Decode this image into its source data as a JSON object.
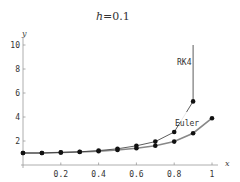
{
  "chart_data": {
    "type": "line",
    "title": "h=0.1",
    "title_var": "h",
    "title_value": "=0.1",
    "xlabel": "x",
    "ylabel": "y",
    "xlim": [
      0,
      1
    ],
    "ylim": [
      0,
      10
    ],
    "x_ticks": [
      "0.2",
      "0.4",
      "0.6",
      "0.8",
      "1"
    ],
    "y_ticks": [
      "2",
      "4",
      "6",
      "8",
      "10"
    ],
    "grid": false,
    "series": [
      {
        "name": "RK4",
        "color": "#333333",
        "x": [
          0,
          0.1,
          0.2,
          0.3,
          0.4,
          0.5,
          0.6,
          0.7,
          0.8,
          0.9
        ],
        "values": [
          1.0,
          1.0,
          1.05,
          1.1,
          1.2,
          1.35,
          1.6,
          1.95,
          2.75,
          5.3
        ],
        "tail_to": 10.0
      },
      {
        "name": "Euler",
        "color": "#888888",
        "x": [
          0,
          0.1,
          0.2,
          0.3,
          0.4,
          0.5,
          0.6,
          0.7,
          0.8,
          0.9,
          1.0
        ],
        "values": [
          1.0,
          1.0,
          1.04,
          1.08,
          1.15,
          1.25,
          1.4,
          1.6,
          1.95,
          2.65,
          3.9
        ]
      }
    ],
    "annotations": [
      {
        "text": "RK4",
        "x": 0.83,
        "y": 8.5
      },
      {
        "text": "Euler",
        "x": 0.82,
        "y": 3.4
      }
    ]
  }
}
